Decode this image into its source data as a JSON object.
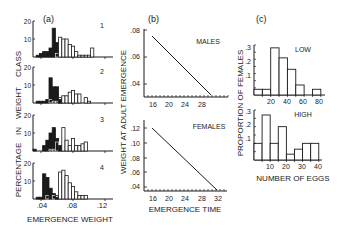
{
  "figure": {
    "panel_labels": [
      "(a)",
      "(b)",
      "(c)"
    ]
  },
  "chart_data": [
    {
      "panel": "(a)",
      "type": "bar",
      "subtype": "stacked-histogram-panels",
      "title": "",
      "xlabel": "EMERGENCE WEIGHT",
      "ylabel": "PERCENTAGE IN WEIGHT CLASS",
      "xlim": [
        0.03,
        0.13
      ],
      "xticks": [
        ".04",
        ".08",
        ".12"
      ],
      "ylim": [
        0,
        20
      ],
      "yticks": [
        "10",
        "20"
      ],
      "bin_width": 0.004,
      "bin_start": 0.03,
      "legend": {
        "filled": "early-emerging (black bars)",
        "open": "late-emerging (white bars)"
      },
      "subpanels": [
        {
          "label": "1",
          "filled": [
            0,
            1,
            2,
            3,
            3,
            5,
            16,
            8,
            0,
            0,
            0,
            0,
            0,
            0,
            0,
            0,
            0,
            0,
            0,
            0,
            0,
            0,
            0,
            0,
            0
          ],
          "open": [
            0,
            0,
            0,
            0,
            0,
            0,
            0,
            2,
            11,
            10,
            10,
            7,
            6,
            3,
            1,
            1,
            1,
            1,
            5,
            0,
            0,
            0,
            0,
            0,
            0
          ]
        },
        {
          "label": "2",
          "filled": [
            0,
            1,
            1,
            1,
            2,
            14,
            9,
            9,
            2,
            0,
            0,
            0,
            0,
            0,
            0,
            0,
            0,
            0,
            0,
            0,
            0,
            0,
            0,
            0,
            0
          ],
          "open": [
            0,
            0,
            0,
            0,
            0,
            2,
            1,
            1,
            3,
            4,
            4,
            6,
            7,
            5,
            5,
            0,
            3,
            1,
            0,
            0,
            0,
            0,
            0,
            0,
            0
          ]
        },
        {
          "label": "3",
          "filled": [
            1,
            0,
            0,
            3,
            6,
            10,
            13,
            7,
            3,
            0,
            0,
            0,
            0,
            0,
            0,
            0,
            0,
            0,
            0,
            0,
            0,
            0,
            0,
            0,
            0
          ],
          "open": [
            0,
            0,
            0,
            0,
            0,
            1,
            1,
            5,
            0,
            13,
            6,
            3,
            7,
            3,
            3,
            4,
            5,
            0,
            0,
            0,
            0,
            0,
            0,
            0,
            0
          ]
        },
        {
          "label": "4",
          "filled": [
            0,
            1,
            1,
            14,
            12,
            6,
            3,
            1,
            0,
            0,
            0,
            0,
            0,
            0,
            0,
            0,
            0,
            0,
            0,
            0,
            0,
            0,
            0,
            0,
            0
          ],
          "open": [
            0,
            0,
            0,
            0,
            2,
            0,
            2,
            2,
            15,
            16,
            13,
            9,
            7,
            4,
            2,
            2,
            2,
            0,
            0,
            0,
            0,
            0,
            0,
            0,
            0
          ]
        }
      ]
    },
    {
      "panel": "(b)",
      "type": "line",
      "xlabel": "EMERGENCE TIME",
      "ylabel": "WEIGHT AT ADULT EMERGENCE",
      "subpanels": [
        {
          "label": "MALES",
          "x": [
            16,
            27.5
          ],
          "y": [
            0.075,
            0.031
          ],
          "xlim": [
            13,
            30
          ],
          "ylim": [
            0.03,
            0.08
          ],
          "xticks": [
            "16",
            "20",
            "24",
            "28"
          ],
          "yticks": [
            ".04",
            ".06",
            ".08"
          ]
        },
        {
          "label": "FEMALES",
          "x": [
            16,
            30.5
          ],
          "y": [
            0.12,
            0.037
          ],
          "xlim": [
            13,
            33
          ],
          "ylim": [
            0.035,
            0.125
          ],
          "xticks": [
            "16",
            "20",
            "24",
            "28",
            "32"
          ],
          "yticks": [
            ".04",
            ".06",
            ".08",
            ".10",
            ".12"
          ]
        }
      ]
    },
    {
      "panel": "(c)",
      "type": "bar",
      "subtype": "histogram",
      "xlabel": "NUMBER OF EGGS",
      "ylabel": "PROPORTION OF FEMALES",
      "subpanels": [
        {
          "label": "LOW",
          "bin_edges": [
            0,
            10,
            20,
            30,
            40,
            50,
            60,
            70,
            80
          ],
          "values": [
            0.04,
            0.04,
            0.33,
            0.26,
            0.18,
            0.07,
            0.0,
            0.04
          ],
          "xlim": [
            0,
            85
          ],
          "ylim": [
            0,
            0.35
          ],
          "xticks": [
            "20",
            "40",
            "60",
            "80"
          ],
          "yticks": [
            ".1",
            ".2",
            ".3"
          ]
        },
        {
          "label": "HIGH",
          "bin_edges": [
            0,
            5,
            10,
            15,
            20,
            25,
            30,
            35,
            40
          ],
          "values": [
            0.1,
            0.27,
            0.1,
            0.2,
            0.035,
            0.065,
            0.1,
            0.1
          ],
          "xlim": [
            0,
            42
          ],
          "ylim": [
            0,
            0.3
          ],
          "xticks": [
            "10",
            "20",
            "30",
            "40"
          ],
          "yticks": [
            ".1",
            ".2",
            ".3"
          ]
        }
      ]
    }
  ],
  "labels": {
    "a_panel": "(a)",
    "b_panel": "(b)",
    "c_panel": "(c)",
    "a_ylabel_1": "CLASS",
    "a_ylabel_2": "WEIGHT",
    "a_ylabel_3": "IN",
    "a_ylabel_4": "PERCENTAGE",
    "a_xlabel": "EMERGENCE WEIGHT",
    "a_sub": [
      "1",
      "2",
      "3",
      "4"
    ],
    "a_xticks": [
      ".04",
      ".08",
      ".12"
    ],
    "a_yticks": [
      "20",
      "10"
    ],
    "b_ylabel": "WEIGHT  AT  ADULT  EMERGENCE",
    "b_xlabel": "EMERGENCE  TIME",
    "b_males": "MALES",
    "b_females": "FEMALES",
    "c_ylabel": "PROPORTION  OF  FEMALES",
    "c_xlabel": "NUMBER OF EGGS",
    "c_low": "LOW",
    "c_high": "HIGH"
  }
}
